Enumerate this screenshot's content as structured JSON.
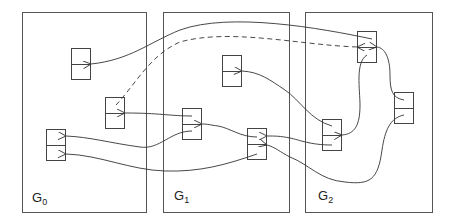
{
  "diagram": {
    "panels": [
      {
        "id": "G0",
        "label_main": "G",
        "label_sub": "0",
        "x": 22,
        "y": 12,
        "w": 125,
        "h": 201
      },
      {
        "id": "G1",
        "label_main": "G",
        "label_sub": "1",
        "x": 163,
        "y": 12,
        "w": 127,
        "h": 201
      },
      {
        "id": "G2",
        "label_main": "G",
        "label_sub": "2",
        "x": 305,
        "y": 12,
        "w": 128,
        "h": 201
      }
    ],
    "nodes": [
      {
        "id": "g0a",
        "panel": "G0",
        "x": 71,
        "y": 48
      },
      {
        "id": "g0b",
        "panel": "G0",
        "x": 105,
        "y": 97
      },
      {
        "id": "g0c",
        "panel": "G0",
        "x": 46,
        "y": 129
      },
      {
        "id": "g1a",
        "panel": "G1",
        "x": 222,
        "y": 55
      },
      {
        "id": "g1b",
        "panel": "G1",
        "x": 182,
        "y": 108
      },
      {
        "id": "g1c",
        "panel": "G1",
        "x": 247,
        "y": 128
      },
      {
        "id": "g2a",
        "panel": "G2",
        "x": 357,
        "y": 31
      },
      {
        "id": "g2b",
        "panel": "G2",
        "x": 394,
        "y": 92
      },
      {
        "id": "g2c",
        "panel": "G2",
        "x": 322,
        "y": 119
      }
    ],
    "edges": [
      {
        "from": "g2a",
        "to": "g0a",
        "style": "solid"
      },
      {
        "from": "g0b",
        "to": "g2a",
        "style": "dashed"
      },
      {
        "from": "g1b",
        "to": "g0b",
        "style": "solid"
      },
      {
        "from": "g1b",
        "to": "g0c",
        "style": "solid"
      },
      {
        "from": "g1c",
        "to": "g0c",
        "style": "solid"
      },
      {
        "from": "g2c",
        "to": "g1a",
        "style": "solid"
      },
      {
        "from": "g1c",
        "to": "g1b",
        "style": "solid"
      },
      {
        "from": "g2c",
        "to": "g1c",
        "style": "solid"
      },
      {
        "from": "g2b",
        "to": "g1c",
        "style": "solid"
      },
      {
        "from": "g2a",
        "to": "g2c",
        "style": "solid"
      },
      {
        "from": "g2b",
        "to": "g2a",
        "style": "solid"
      }
    ],
    "colors": {
      "stroke": "#333333",
      "panel_border": "#555555",
      "background": "#ffffff"
    }
  }
}
